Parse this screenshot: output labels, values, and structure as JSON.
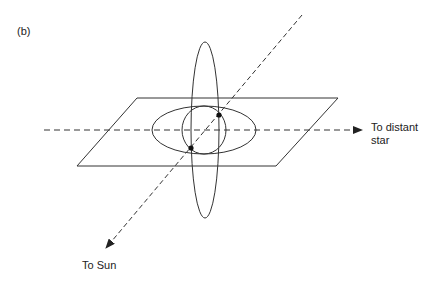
{
  "figure": {
    "panel_label": "(b)",
    "labels": {
      "distant_star_line1": "To distant",
      "distant_star_line2": "star",
      "sun": "To Sun"
    },
    "colors": {
      "stroke": "#333333",
      "background": "#ffffff"
    },
    "elements": [
      "ecliptic-plane",
      "horizontal-orbit-ellipse",
      "inner-circle-orbit",
      "vertical-orbit-ellipse",
      "line-to-distant-star",
      "line-to-sun",
      "intersection-point-upper",
      "intersection-point-lower"
    ]
  }
}
